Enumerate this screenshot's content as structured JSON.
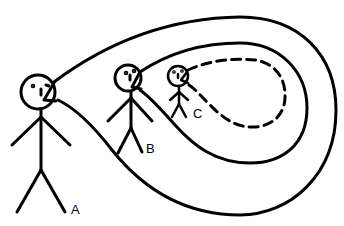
{
  "diagram": {
    "stroke_color": "#000000",
    "background": "#ffffff",
    "figures": [
      {
        "id": "A",
        "label": "A",
        "loop_style": "solid",
        "loop": "outer"
      },
      {
        "id": "B",
        "label": "B",
        "loop_style": "solid",
        "loop": "middle"
      },
      {
        "id": "C",
        "label": "C",
        "loop_style": "dashed",
        "loop": "inner"
      }
    ]
  }
}
